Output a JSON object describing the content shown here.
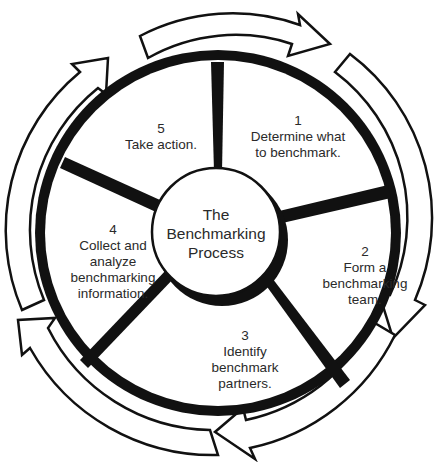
{
  "diagram": {
    "title": "The Benchmarking Process",
    "center": {
      "lines": [
        "The",
        "Benchmarking",
        "Process"
      ]
    },
    "steps": [
      {
        "number": "1",
        "lines": [
          "Determine what",
          "to benchmark."
        ]
      },
      {
        "number": "2",
        "lines": [
          "Form a",
          "benchmarking",
          "team."
        ]
      },
      {
        "number": "3",
        "lines": [
          "Identify",
          "benchmark",
          "partners."
        ]
      },
      {
        "number": "4",
        "lines": [
          "Collect and",
          "analyze",
          "benchmarking",
          "information."
        ]
      },
      {
        "number": "5",
        "lines": [
          "Take action."
        ]
      }
    ],
    "colors": {
      "ink": "#111111",
      "paper": "#ffffff",
      "text": "#2a2a2a"
    },
    "flow_direction": "clockwise"
  }
}
